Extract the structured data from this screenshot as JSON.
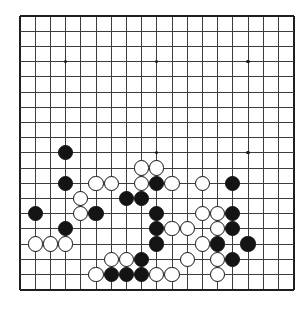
{
  "board": {
    "title": "go-board",
    "type": "go-game-board",
    "size": 19,
    "visible_columns": 19,
    "visible_rows": 19,
    "origin_x": 20,
    "origin_y": 16,
    "spacing": 15.2,
    "colors": {
      "background": "#ffffff",
      "grid": "#3c3c3c",
      "border": "#1e1e1e",
      "black_stone": "#141414",
      "white_stone": "#ffffff",
      "stone_outline": "#111111",
      "hoshi": "#1a1a1a"
    },
    "stone_radius": 7.6,
    "hoshi_points": [
      {
        "col": 3,
        "row": 3
      },
      {
        "col": 9,
        "row": 3
      },
      {
        "col": 15,
        "row": 3
      },
      {
        "col": 3,
        "row": 9
      },
      {
        "col": 9,
        "row": 9
      },
      {
        "col": 15,
        "row": 9
      }
    ],
    "stones": [
      {
        "col": 3,
        "row": 9,
        "color": "black"
      },
      {
        "col": 3,
        "row": 11,
        "color": "black"
      },
      {
        "col": 5,
        "row": 11,
        "color": "white"
      },
      {
        "col": 6,
        "row": 11,
        "color": "white"
      },
      {
        "col": 8,
        "row": 10,
        "color": "white"
      },
      {
        "col": 9,
        "row": 10,
        "color": "white"
      },
      {
        "col": 8,
        "row": 11,
        "color": "white"
      },
      {
        "col": 9,
        "row": 11,
        "color": "black"
      },
      {
        "col": 10,
        "row": 11,
        "color": "white"
      },
      {
        "col": 12,
        "row": 11,
        "color": "white"
      },
      {
        "col": 14,
        "row": 11,
        "color": "black"
      },
      {
        "col": 4,
        "row": 12,
        "color": "white"
      },
      {
        "col": 7,
        "row": 12,
        "color": "black"
      },
      {
        "col": 8,
        "row": 12,
        "color": "black"
      },
      {
        "col": 1,
        "row": 13,
        "color": "black"
      },
      {
        "col": 4,
        "row": 13,
        "color": "white"
      },
      {
        "col": 5,
        "row": 13,
        "color": "black"
      },
      {
        "col": 9,
        "row": 13,
        "color": "black"
      },
      {
        "col": 12,
        "row": 13,
        "color": "white"
      },
      {
        "col": 13,
        "row": 13,
        "color": "white"
      },
      {
        "col": 14,
        "row": 13,
        "color": "black"
      },
      {
        "col": 3,
        "row": 14,
        "color": "black"
      },
      {
        "col": 9,
        "row": 14,
        "color": "black"
      },
      {
        "col": 10,
        "row": 14,
        "color": "white"
      },
      {
        "col": 11,
        "row": 14,
        "color": "white"
      },
      {
        "col": 13,
        "row": 14,
        "color": "white"
      },
      {
        "col": 14,
        "row": 14,
        "color": "black"
      },
      {
        "col": 1,
        "row": 15,
        "color": "white"
      },
      {
        "col": 2,
        "row": 15,
        "color": "white"
      },
      {
        "col": 3,
        "row": 15,
        "color": "white"
      },
      {
        "col": 9,
        "row": 15,
        "color": "black"
      },
      {
        "col": 12,
        "row": 15,
        "color": "white"
      },
      {
        "col": 13,
        "row": 15,
        "color": "black"
      },
      {
        "col": 15,
        "row": 15,
        "color": "black"
      },
      {
        "col": 6,
        "row": 16,
        "color": "white"
      },
      {
        "col": 7,
        "row": 16,
        "color": "white"
      },
      {
        "col": 8,
        "row": 16,
        "color": "black"
      },
      {
        "col": 11,
        "row": 16,
        "color": "white"
      },
      {
        "col": 13,
        "row": 16,
        "color": "white"
      },
      {
        "col": 14,
        "row": 16,
        "color": "black"
      },
      {
        "col": 5,
        "row": 17,
        "color": "white"
      },
      {
        "col": 6,
        "row": 17,
        "color": "black"
      },
      {
        "col": 7,
        "row": 17,
        "color": "black"
      },
      {
        "col": 8,
        "row": 17,
        "color": "black"
      },
      {
        "col": 9,
        "row": 17,
        "color": "white"
      },
      {
        "col": 10,
        "row": 17,
        "color": "white"
      },
      {
        "col": 13,
        "row": 17,
        "color": "white"
      }
    ]
  }
}
